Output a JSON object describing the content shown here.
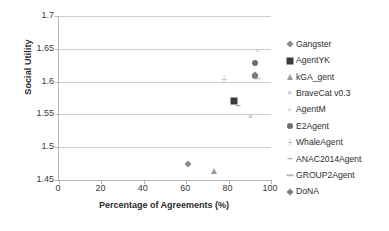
{
  "chart_data": {
    "type": "scatter",
    "title": "",
    "xlabel": "Percentage of Agreements (%)",
    "ylabel": "Social Utility",
    "xlim": [
      0,
      100
    ],
    "ylim": [
      1.45,
      1.7
    ],
    "xticks": [
      0,
      20,
      40,
      60,
      80,
      100
    ],
    "yticks": [
      1.45,
      1.5,
      1.55,
      1.6,
      1.65,
      1.7
    ],
    "xtick_labels": [
      "0",
      "20",
      "40",
      "60",
      "80",
      "100"
    ],
    "ytick_labels": [
      "1.45",
      "1.5",
      "1.55",
      "1.6",
      "1.65",
      "1.7"
    ],
    "grid": "horizontal",
    "legend_position": "right",
    "series": [
      {
        "name": "Gangster",
        "marker": "diamond",
        "color": "#8a8a8a",
        "points": [
          [
            61.0,
            1.474
          ]
        ]
      },
      {
        "name": "AgentYK",
        "marker": "square",
        "color": "#3b3b3b",
        "points": [
          [
            82.7,
            1.57
          ]
        ]
      },
      {
        "name": "kGA_gent",
        "marker": "triangle",
        "color": "#9d9d9d",
        "points": [
          [
            73.2,
            1.463
          ]
        ]
      },
      {
        "name": "BraveCat v0.3",
        "marker": "cross",
        "color": "#9a9a9a",
        "points": [
          [
            90.2,
            1.546
          ]
        ]
      },
      {
        "name": "AgentM",
        "marker": "cross-light",
        "color": "#bdbdbd",
        "points": [
          [
            93.6,
            1.647
          ]
        ]
      },
      {
        "name": "E2Agent",
        "marker": "circle",
        "color": "#6e6e6e",
        "points": [
          [
            92.4,
            1.628
          ],
          [
            92.4,
            1.608
          ]
        ]
      },
      {
        "name": "WhaleAgent",
        "marker": "plus",
        "color": "#b0b0b0",
        "points": [
          [
            78.0,
            1.603
          ]
        ]
      },
      {
        "name": "ANAC2014Agent",
        "marker": "dash",
        "color": "#9a9a9a",
        "points": [
          [
            84.6,
            1.563
          ]
        ]
      },
      {
        "name": "GROUP2Agent",
        "marker": "dash-long",
        "color": "#b8b8b8",
        "points": [
          [
            93.2,
            1.604
          ]
        ]
      },
      {
        "name": "DoNA",
        "marker": "diamond2",
        "color": "#7d7d7d",
        "points": [
          [
            92.6,
            1.61
          ]
        ]
      }
    ]
  },
  "legend": {
    "items": [
      {
        "label": "Gangster",
        "marker": "diamond"
      },
      {
        "label": "AgentYK",
        "marker": "square"
      },
      {
        "label": "kGA_gent",
        "marker": "triangle"
      },
      {
        "label": "BraveCat v0.3",
        "marker": "cross"
      },
      {
        "label": "AgentM",
        "marker": "cross-light"
      },
      {
        "label": "E2Agent",
        "marker": "circle"
      },
      {
        "label": "WhaleAgent",
        "marker": "plus"
      },
      {
        "label": "ANAC2014Agent",
        "marker": "dash"
      },
      {
        "label": "GROUP2Agent",
        "marker": "dash-long"
      },
      {
        "label": "DoNA",
        "marker": "diamond2"
      }
    ]
  }
}
